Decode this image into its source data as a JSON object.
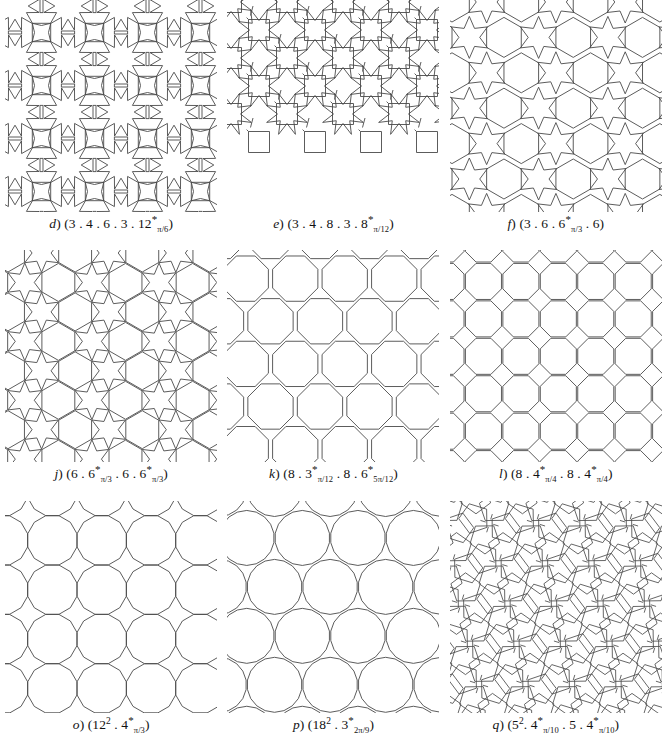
{
  "figure": {
    "background": "#ffffff",
    "stroke_color": "#4a4a4a",
    "panel_count": 9,
    "rows": 3,
    "columns": 3
  },
  "panels": [
    {
      "id": "d",
      "letter": "(d)",
      "caption_plain": "(3 . 4 . 6 . 3 . 12*π/6)",
      "vertex_parts": [
        "3",
        ".",
        "4",
        ".",
        "6",
        ".",
        "3",
        ".",
        "12"
      ],
      "star_polygon": "12",
      "star_angle": "π/6",
      "description": "twelve-pointed stars with squares and triangles"
    },
    {
      "id": "e",
      "letter": "(e)",
      "caption_plain": "(3 . 4 . 8 . 3 . 8*π/12)",
      "vertex_parts": [
        "3",
        ".",
        "4",
        ".",
        "8",
        ".",
        "3",
        ".",
        "8"
      ],
      "star_polygon": "8",
      "star_angle": "π/12",
      "description": "eight-pointed stars with squares and triangles"
    },
    {
      "id": "f",
      "letter": "(f)",
      "caption_plain": "(3 . 6 . 6*π/3 . 6)",
      "vertex_parts": [
        "3",
        ".",
        "6",
        ".",
        "6",
        ".",
        "6"
      ],
      "star_polygon": "6",
      "star_angle": "π/3",
      "description": "six-pointed stars with hexagons and triangles"
    },
    {
      "id": "j",
      "letter": "(j)",
      "caption_plain": "(6 . 6*π/3 . 6 . 6*π/3)",
      "vertex_parts": [
        "6",
        ".",
        "6",
        ".",
        "6",
        ".",
        "6"
      ],
      "star_polygon": "6",
      "star_angle": "π/3",
      "description": "hexagons with six-pointed stars"
    },
    {
      "id": "k",
      "letter": "(k)",
      "caption_plain": "(8 . 3*π/12 . 8 . 6*5π/12)",
      "vertex_parts": [
        "8",
        ".",
        "3",
        ".",
        "8",
        ".",
        "6"
      ],
      "star_polygon": "8",
      "star_angle": "5π/12",
      "description": "octagons with triangular and hexagonal star gaps"
    },
    {
      "id": "l",
      "letter": "(l)",
      "caption_plain": "(8 . 4*π/4 . 8 . 4*π/4)",
      "vertex_parts": [
        "8",
        ".",
        "4",
        ".",
        "8",
        ".",
        "4"
      ],
      "star_polygon": "8",
      "star_angle": "π/4",
      "description": "octagons in a square grid with four-pointed stars"
    },
    {
      "id": "o",
      "letter": "(o)",
      "caption_plain": "(12² . 4*π/3)",
      "vertex_parts": [
        "12",
        ".",
        "4"
      ],
      "star_polygon": "4",
      "star_angle": "π/3",
      "description": "dodecagons with four-pointed stars"
    },
    {
      "id": "p",
      "letter": "(p)",
      "caption_plain": "(18² . 3*2π/9)",
      "vertex_parts": [
        "18",
        ".",
        "3"
      ],
      "star_polygon": "3",
      "star_angle": "2π/9",
      "description": "eighteen-gons with three-pointed stars"
    },
    {
      "id": "q",
      "letter": "(q)",
      "caption_plain": "(5² . 4*π/10 . 5 . 4*π/10)",
      "vertex_parts": [
        "5",
        ".",
        "4",
        ".",
        "5",
        ".",
        "4"
      ],
      "star_polygon": "4",
      "star_angle": "π/10",
      "description": "pentagons with four-pointed stars"
    }
  ],
  "captions": {
    "d": {
      "letter": "d",
      "pre": "(3 . 4 . 6 . 3 . 12",
      "star": "*",
      "sub": "π/6",
      "post": ")"
    },
    "e": {
      "letter": "e",
      "pre": "(3 . 4 . 8 . 3 . 8",
      "star": "*",
      "sub": "π/12",
      "post": ")"
    },
    "f": {
      "letter": "f",
      "pre": "(3 . 6 . 6",
      "star": "*",
      "sub": "π/3",
      "post": " . 6)"
    },
    "j": {
      "letter": "j",
      "pre": "(6 . 6",
      "star": "*",
      "sub": "π/3",
      "mid": " . 6 . 6",
      "star2": "*",
      "sub2": "π/3",
      "post": ")"
    },
    "k": {
      "letter": "k",
      "pre": "(8 . 3",
      "star": "*",
      "sub": "π/12",
      "mid": " . 8 . 6",
      "star2": "*",
      "sub2": "5π/12",
      "post": ")"
    },
    "l": {
      "letter": "l",
      "pre": "(8 . 4",
      "star": "*",
      "sub": "π/4",
      "mid": " . 8 . 4",
      "star2": "*",
      "sub2": "π/4",
      "post": ")"
    },
    "o": {
      "letter": "o",
      "pre": "(12",
      "sup": "2",
      "mid": " . 4",
      "star2": "*",
      "sub2": "π/3",
      "post": ")"
    },
    "p": {
      "letter": "p",
      "pre": "(18",
      "sup": "2",
      "mid": " . 3",
      "star2": "*",
      "sub2": "2π/9",
      "post": ")"
    },
    "q": {
      "letter": "q",
      "pre": "(5",
      "sup": "2",
      "mid": ". 4",
      "star2": "*",
      "sub2": "π/10",
      "mid2": " . 5 . 4",
      "star3": "*",
      "sub3": "π/10",
      "post": ")"
    }
  }
}
